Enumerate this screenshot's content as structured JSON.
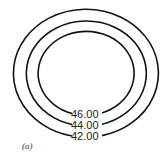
{
  "figure": {
    "panel_label": "(a)",
    "type": "contour-plot",
    "stroke_color": "#111111",
    "background": "#ffffff"
  },
  "contours": [
    {
      "level": 46.0,
      "label": "46.00",
      "cx": 84,
      "cy": 72,
      "rx": 48,
      "ry": 42
    },
    {
      "level": 44.0,
      "label": "44.00",
      "cx": 83,
      "cy": 72.5,
      "rx": 60,
      "ry": 52.5
    },
    {
      "level": 42.0,
      "label": "42.00",
      "cx": 82.5,
      "cy": 72,
      "rx": 72.5,
      "ry": 64
    }
  ]
}
